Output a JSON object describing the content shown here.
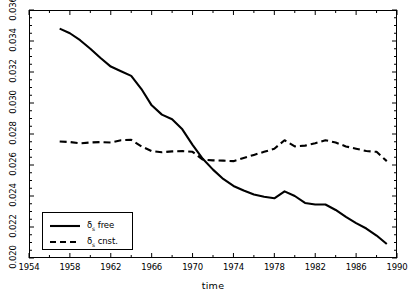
{
  "chart_data": {
    "type": "line",
    "title": "",
    "xlabel": "time",
    "ylabel": "",
    "xlim": [
      1954,
      1990
    ],
    "ylim": [
      0.02,
      0.036
    ],
    "grid": false,
    "legend_position": "lower-left",
    "x_ticks": [
      1954,
      1958,
      1962,
      1966,
      1970,
      1974,
      1978,
      1982,
      1986,
      1990
    ],
    "x_tick_labels": [
      "1954",
      "1958",
      "1962",
      "1966",
      "1970",
      "1974",
      "1978",
      "1982",
      "1986",
      "1990"
    ],
    "x_minor_tick_step": 2,
    "y_ticks": [
      0.02,
      0.022,
      0.024,
      0.026,
      0.028,
      0.03,
      0.032,
      0.034,
      0.036
    ],
    "y_tick_labels": [
      "0.020",
      "0.022",
      "0.024",
      "0.026",
      "0.028",
      "0.030",
      "0.032",
      "0.034",
      "0.036"
    ],
    "y_minor_tick_step": 0.0005,
    "series": [
      {
        "name": "delta_s free",
        "label_html": "δ<sub>s</sub> free",
        "style": "solid",
        "color": "#000000",
        "width": 2.1,
        "x": [
          1957,
          1958,
          1959,
          1960,
          1961,
          1962,
          1963,
          1964,
          1965,
          1966,
          1967,
          1968,
          1969,
          1970,
          1971,
          1972,
          1973,
          1974,
          1975,
          1976,
          1977,
          1978,
          1979,
          1980,
          1981,
          1982,
          1983,
          1984,
          1985,
          1986,
          1987,
          1988,
          1989
        ],
        "y": [
          0.0348,
          0.0345,
          0.03405,
          0.0335,
          0.0329,
          0.03235,
          0.03205,
          0.03175,
          0.0309,
          0.02985,
          0.02925,
          0.02895,
          0.0283,
          0.0273,
          0.0264,
          0.0257,
          0.0251,
          0.02465,
          0.02435,
          0.0241,
          0.02395,
          0.02385,
          0.0243,
          0.024,
          0.02355,
          0.02345,
          0.02345,
          0.0231,
          0.02265,
          0.02225,
          0.0219,
          0.02145,
          0.0209
        ]
      },
      {
        "name": "delta_s cnst.",
        "label_html": "δ<sub>s</sub> cnst.",
        "style": "dashed",
        "color": "#000000",
        "width": 2.1,
        "dash": "7,4",
        "x": [
          1957,
          1958,
          1959,
          1960,
          1961,
          1962,
          1963,
          1964,
          1965,
          1966,
          1967,
          1968,
          1969,
          1970,
          1971,
          1972,
          1973,
          1974,
          1975,
          1976,
          1977,
          1978,
          1979,
          1980,
          1981,
          1982,
          1983,
          1984,
          1985,
          1986,
          1987,
          1988,
          1989
        ],
        "y": [
          0.02752,
          0.02748,
          0.0274,
          0.02745,
          0.02748,
          0.02745,
          0.0276,
          0.02762,
          0.0272,
          0.0269,
          0.02682,
          0.02688,
          0.0269,
          0.02685,
          0.02635,
          0.0263,
          0.02628,
          0.02625,
          0.02645,
          0.02665,
          0.02685,
          0.02705,
          0.0276,
          0.0272,
          0.02725,
          0.0274,
          0.0276,
          0.02745,
          0.0272,
          0.02705,
          0.0269,
          0.02685,
          0.02625
        ]
      }
    ]
  },
  "legend": {
    "items": [
      {
        "label_html": "δ<sub>s</sub> free",
        "style": "solid"
      },
      {
        "label_html": "δ<sub>s</sub> cnst.",
        "style": "dashed"
      }
    ]
  },
  "axis": {
    "x_title": "time"
  }
}
